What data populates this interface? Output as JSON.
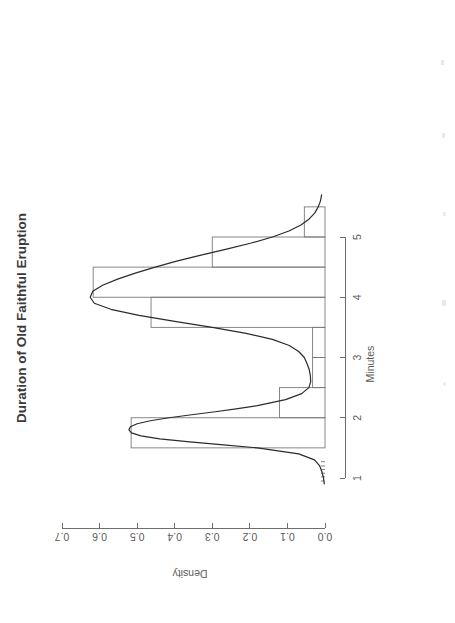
{
  "page": {
    "background_color": "#ffffff",
    "width": 455,
    "height": 623,
    "orientation_note": "plot rotated 90 degrees counter-clockwise on the page"
  },
  "title": {
    "text": "Duration of Old Faithful Eruption",
    "color": "#3a3a3a"
  },
  "axes": {
    "x": {
      "title": "Minutes",
      "ticks": [
        "1",
        "2",
        "3",
        "4",
        "5"
      ],
      "tick_values": [
        1,
        2,
        3,
        4,
        5
      ],
      "range": [
        0.5,
        5.8
      ]
    },
    "y": {
      "title": "Density",
      "ticks": [
        "0.0",
        "0.1",
        "0.2",
        "0.3",
        "0.4",
        "0.5",
        "0.6",
        "0.7"
      ],
      "tick_values": [
        0.0,
        0.1,
        0.2,
        0.3,
        0.4,
        0.5,
        0.6,
        0.7
      ],
      "range": [
        0.0,
        0.72
      ]
    }
  },
  "colors": {
    "axis": "#6e6e6e",
    "histogram_outline": "#7a7a7a",
    "density_line": "#2b2b2b",
    "tick_label": "#5a5a5a"
  },
  "chart_data": {
    "type": "histogram",
    "title": "Duration of Old Faithful Eruption",
    "xlabel": "Minutes",
    "ylabel": "Density",
    "xlim": [
      0.5,
      5.8
    ],
    "ylim": [
      0.0,
      0.72
    ],
    "grid": false,
    "legend": false,
    "histogram": {
      "bin_edges": [
        1.5,
        2.0,
        2.5,
        3.0,
        3.5,
        4.0,
        4.5,
        5.0,
        5.5
      ],
      "bin_density": [
        0.516,
        0.121,
        0.033,
        0.033,
        0.463,
        0.617,
        0.3,
        0.055
      ],
      "note": "density-scaled histogram of faithful$eruptions, binwidth 0.5"
    },
    "density_curve": {
      "name": "Kernel density estimate",
      "x": [
        0.9,
        1.0,
        1.1,
        1.2,
        1.3,
        1.4,
        1.5,
        1.55,
        1.6,
        1.65,
        1.7,
        1.75,
        1.8,
        1.85,
        1.9,
        1.95,
        2.0,
        2.05,
        2.1,
        2.15,
        2.2,
        2.3,
        2.4,
        2.5,
        2.6,
        2.7,
        2.8,
        2.9,
        3.0,
        3.1,
        3.2,
        3.3,
        3.4,
        3.5,
        3.6,
        3.7,
        3.8,
        3.9,
        4.0,
        4.1,
        4.2,
        4.3,
        4.4,
        4.5,
        4.6,
        4.7,
        4.8,
        4.9,
        5.0,
        5.1,
        5.2,
        5.3,
        5.4,
        5.5,
        5.6,
        5.7
      ],
      "y": [
        0.002,
        0.004,
        0.008,
        0.014,
        0.028,
        0.07,
        0.18,
        0.27,
        0.36,
        0.44,
        0.49,
        0.515,
        0.522,
        0.518,
        0.5,
        0.465,
        0.415,
        0.355,
        0.292,
        0.232,
        0.18,
        0.105,
        0.062,
        0.043,
        0.038,
        0.039,
        0.042,
        0.048,
        0.055,
        0.07,
        0.095,
        0.14,
        0.21,
        0.3,
        0.4,
        0.495,
        0.57,
        0.614,
        0.625,
        0.618,
        0.592,
        0.552,
        0.505,
        0.452,
        0.395,
        0.33,
        0.262,
        0.196,
        0.14,
        0.096,
        0.064,
        0.042,
        0.027,
        0.018,
        0.012,
        0.009
      ]
    }
  }
}
